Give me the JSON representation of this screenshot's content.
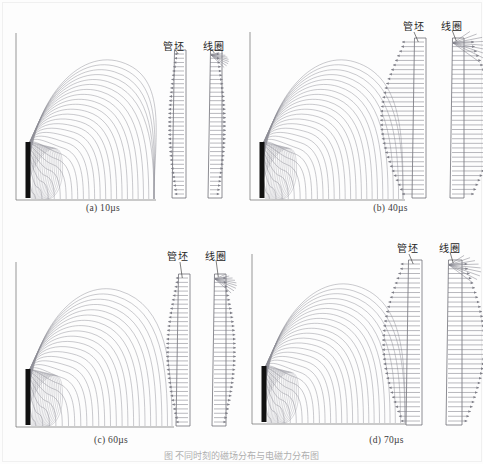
{
  "figure": {
    "caption": "图 不同时刻的磁场分布与电磁力分布图",
    "label_blank": "管坯",
    "label_coil": "线圈",
    "colors": {
      "flux_line": "#8c8c96",
      "coil_solid": "#111111",
      "axis": "#6a6a6a",
      "arrow": "#7d7d86",
      "box_outline": "#5c5c64",
      "background": "#fdfdfd"
    }
  },
  "panels": [
    {
      "id": "a",
      "caption": "(a)  10µs",
      "time_value": 10,
      "time_unit": "µs",
      "flux_lines": 26,
      "flux_max_radius": 150,
      "arrow_scale": 0.3,
      "blank_label": "管坯",
      "coil_label": "线圈"
    },
    {
      "id": "b",
      "caption": "(b)  40µs",
      "time_value": 40,
      "time_unit": "µs",
      "flux_lines": 26,
      "flux_max_radius": 150,
      "arrow_scale": 1.0,
      "blank_label": "管坯",
      "coil_label": "线圈"
    },
    {
      "id": "c",
      "caption": "(c)  60µs",
      "time_value": 60,
      "time_unit": "µs",
      "flux_lines": 24,
      "flux_max_radius": 148,
      "arrow_scale": 0.45,
      "blank_label": "管坯",
      "coil_label": "线圈"
    },
    {
      "id": "d",
      "caption": "(d)  70µs",
      "time_value": 70,
      "time_unit": "µs",
      "flux_lines": 26,
      "flux_max_radius": 150,
      "arrow_scale": 0.85,
      "blank_label": "管坯",
      "coil_label": "线圈"
    }
  ],
  "chart_data": {
    "type": "line",
    "title": "不同时刻的磁场分布与电磁力分布图",
    "xlabel": "",
    "ylabel": "",
    "legend": [
      "管坯",
      "线圈"
    ],
    "legend_position": "top-right-inside",
    "grid": false,
    "subplots": [
      {
        "name": "(a) 10µs",
        "time_us": 10,
        "description": "Magnetic flux contour lines in quarter plane; vector field arrows small",
        "flux_contour_count": 26,
        "relative_force_magnitude": 0.3
      },
      {
        "name": "(b) 40µs",
        "time_us": 40,
        "description": "Magnetic flux contour lines in quarter plane; vector field arrows largest",
        "flux_contour_count": 26,
        "relative_force_magnitude": 1.0
      },
      {
        "name": "(c) 60µs",
        "time_us": 60,
        "description": "Magnetic flux contour lines in quarter plane; vector field arrows medium-small",
        "flux_contour_count": 24,
        "relative_force_magnitude": 0.45
      },
      {
        "name": "(d) 70µs",
        "time_us": 70,
        "description": "Magnetic flux contour lines in quarter plane; vector field arrows large",
        "flux_contour_count": 26,
        "relative_force_magnitude": 0.85
      }
    ],
    "series": [
      {
        "name": "relative electromagnetic force",
        "x": [
          10,
          40,
          60,
          70
        ],
        "values": [
          0.3,
          1.0,
          0.45,
          0.85
        ]
      }
    ],
    "categories": [
      "10µs",
      "40µs",
      "60µs",
      "70µs"
    ]
  }
}
